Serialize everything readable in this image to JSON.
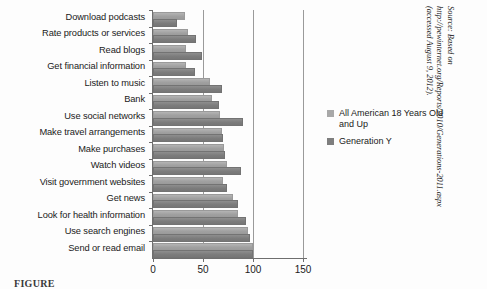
{
  "chart_data": {
    "type": "bar",
    "orientation": "horizontal",
    "title": "",
    "xlabel": "",
    "ylabel": "",
    "xlim": [
      0,
      155
    ],
    "xticks": [
      0,
      50,
      100,
      150
    ],
    "xtick_labels": [
      "0",
      "50",
      "100",
      "150"
    ],
    "grid": true,
    "legend_position": "right",
    "categories": [
      "Download podcasts",
      "Rate products or services",
      "Read blogs",
      "Get financial information",
      "Listen to music",
      "Bank",
      "Use social networks",
      "Make travel arrangements",
      "Make purchases",
      "Watch videos",
      "Visit government websites",
      "Get news",
      "Look for health information",
      "Use search engines",
      "Send or read email"
    ],
    "series": [
      {
        "name": "All American 18 Years Old and Up",
        "color": "#a8a8a8",
        "values": [
          30,
          33,
          31,
          31,
          55,
          57,
          65,
          67,
          69,
          72,
          68,
          78,
          83,
          93,
          98
        ]
      },
      {
        "name": "Generation Y",
        "color": "#7e7e7e",
        "values": [
          22,
          41,
          47,
          40,
          67,
          64,
          88,
          68,
          70,
          86,
          72,
          83,
          91,
          95,
          98
        ]
      }
    ]
  },
  "legend": {
    "entries": [
      "All American 18 Years Old and Up",
      "Generation Y"
    ]
  },
  "source_note": "Source: Based on http://pewinternet.org/Reports/2010/Generations-2011.aspx (accessed August 9, 2012).",
  "caption": "FIGURE"
}
